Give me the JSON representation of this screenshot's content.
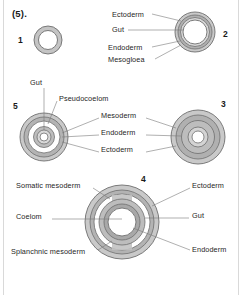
{
  "figure": {
    "caption_number": "(5).",
    "background_color": "#ffffff",
    "frame_color": "#d9d9d9",
    "ring_stroke_color": "#6e6e6e",
    "ring_fill_light": "#d0d0d0",
    "ring_fill_mid": "#b5b5b5",
    "ring_fill_dark": "#9a9a9a",
    "cavity_color": "#ffffff",
    "leader_line_color": "#7a7a7a",
    "text_color": "#262626"
  },
  "stages": [
    {
      "number": "1",
      "number_x": 18,
      "number_y": 35,
      "center_x": 48,
      "center_y": 40,
      "labels": []
    },
    {
      "number": "2",
      "number_x": 223,
      "number_y": 29,
      "center_x": 195,
      "center_y": 32,
      "labels": [
        {
          "text": "Ectoderm",
          "x": 112,
          "y": 14
        },
        {
          "text": "Gut",
          "x": 112,
          "y": 29
        },
        {
          "text": "Endoderm",
          "x": 108,
          "y": 47
        },
        {
          "text": "Mesogloea",
          "x": 108,
          "y": 60
        }
      ]
    },
    {
      "number": "5",
      "number_x": 13,
      "number_y": 101,
      "center_x": 44,
      "center_y": 137,
      "labels": [
        {
          "text": "Gut",
          "x": 30,
          "y": 82
        },
        {
          "text": "Pseudocoelom",
          "x": 59,
          "y": 98
        }
      ]
    },
    {
      "number": "3",
      "number_x": 221,
      "number_y": 99,
      "center_x": 198,
      "center_y": 137,
      "labels": []
    },
    {
      "number": "4",
      "number_x": 141,
      "number_y": 174,
      "center_x": 122,
      "center_y": 222,
      "labels": [
        {
          "text": "Somatic mesoderm",
          "x": 16,
          "y": 185
        },
        {
          "text": "Coelom",
          "x": 16,
          "y": 216
        },
        {
          "text": "Splanchnic mesoderm",
          "x": 11,
          "y": 251
        },
        {
          "text": "Ectoderm",
          "x": 192,
          "y": 185
        },
        {
          "text": "Gut",
          "x": 192,
          "y": 215
        },
        {
          "text": "Endoderm",
          "x": 192,
          "y": 249
        }
      ]
    }
  ],
  "shared_middle_labels": [
    {
      "text": "Mesoderm",
      "x": 101,
      "y": 115
    },
    {
      "text": "Endoderm",
      "x": 101,
      "y": 132
    },
    {
      "text": "Ectoderm",
      "x": 101,
      "y": 149
    }
  ]
}
